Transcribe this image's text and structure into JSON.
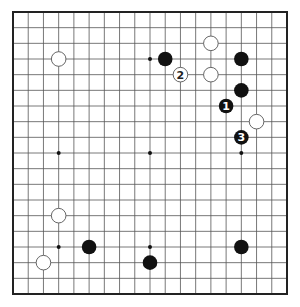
{
  "diagram": {
    "type": "go-board",
    "size": 19,
    "colors": {
      "background": "#ffffff",
      "grid": "#555555",
      "border": "#222222",
      "black_stone": "#111111",
      "white_stone": "#ffffff",
      "white_outline": "#555555",
      "star": "#111111"
    },
    "star_points": [
      [
        3,
        3
      ],
      [
        9,
        3
      ],
      [
        15,
        3
      ],
      [
        3,
        9
      ],
      [
        9,
        9
      ],
      [
        15,
        9
      ],
      [
        3,
        15
      ],
      [
        9,
        15
      ],
      [
        15,
        15
      ]
    ],
    "stones": [
      {
        "color": "white",
        "col": 3,
        "row": 3,
        "label": ""
      },
      {
        "color": "black",
        "col": 10,
        "row": 3,
        "label": ""
      },
      {
        "color": "white",
        "col": 11,
        "row": 4,
        "label": "2"
      },
      {
        "color": "white",
        "col": 13,
        "row": 2,
        "label": ""
      },
      {
        "color": "white",
        "col": 13,
        "row": 4,
        "label": ""
      },
      {
        "color": "black",
        "col": 15,
        "row": 3,
        "label": ""
      },
      {
        "color": "black",
        "col": 15,
        "row": 5,
        "label": ""
      },
      {
        "color": "black",
        "col": 14,
        "row": 6,
        "label": "1"
      },
      {
        "color": "white",
        "col": 16,
        "row": 7,
        "label": ""
      },
      {
        "color": "black",
        "col": 15,
        "row": 8,
        "label": "3"
      },
      {
        "color": "white",
        "col": 3,
        "row": 13,
        "label": ""
      },
      {
        "color": "black",
        "col": 5,
        "row": 15,
        "label": ""
      },
      {
        "color": "white",
        "col": 2,
        "row": 16,
        "label": ""
      },
      {
        "color": "black",
        "col": 9,
        "row": 16,
        "label": ""
      },
      {
        "color": "black",
        "col": 15,
        "row": 15,
        "label": ""
      }
    ]
  }
}
